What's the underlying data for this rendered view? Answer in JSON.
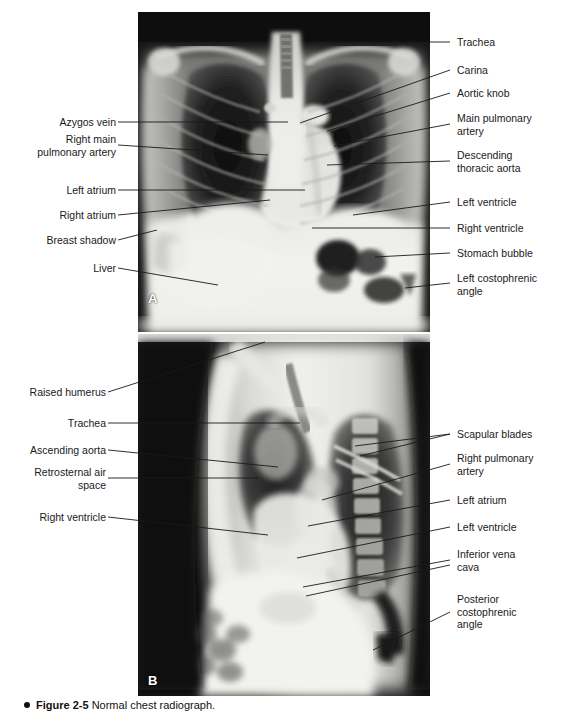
{
  "figure": {
    "caption_bullet": "●",
    "caption_label": "Figure 2-5",
    "caption_text": "Normal chest radiograph.",
    "panel_a_letter": "A",
    "panel_b_letter": "B"
  },
  "colors": {
    "text": "#1a1a1a",
    "leader": "#1a1a1a",
    "leader_on_film": "#f2f2f2",
    "page_background": "#ffffff",
    "film_dark": "#0d0d0d",
    "film_light": "#f0f0ee"
  },
  "panel_a": {
    "name": "posteroanterior-chest-radiograph",
    "labels_left": [
      {
        "id": "azygos-vein",
        "text": "Azygos vein"
      },
      {
        "id": "right-main-pulmonary-artery",
        "text": "Right main\npulmonary artery"
      },
      {
        "id": "left-atrium",
        "text": "Left atrium"
      },
      {
        "id": "right-atrium",
        "text": "Right atrium"
      },
      {
        "id": "breast-shadow",
        "text": "Breast shadow"
      },
      {
        "id": "liver",
        "text": "Liver"
      }
    ],
    "labels_right": [
      {
        "id": "trachea",
        "text": "Trachea"
      },
      {
        "id": "carina",
        "text": "Carina"
      },
      {
        "id": "aortic-knob",
        "text": "Aortic knob"
      },
      {
        "id": "main-pulmonary-artery",
        "text": "Main pulmonary\nartery"
      },
      {
        "id": "descending-thoracic-aorta",
        "text": "Descending\nthoracic aorta"
      },
      {
        "id": "left-ventricle",
        "text": "Left ventricle"
      },
      {
        "id": "right-ventricle",
        "text": "Right ventricle"
      },
      {
        "id": "stomach-bubble",
        "text": "Stomach bubble"
      },
      {
        "id": "left-costophrenic-angle",
        "text": "Left costophrenic\nangle"
      }
    ]
  },
  "panel_b": {
    "name": "lateral-chest-radiograph",
    "labels_left": [
      {
        "id": "raised-humerus",
        "text": "Raised humerus"
      },
      {
        "id": "trachea",
        "text": "Trachea"
      },
      {
        "id": "ascending-aorta",
        "text": "Ascending aorta"
      },
      {
        "id": "retrosternal-air-space",
        "text": "Retrosternal air\nspace"
      },
      {
        "id": "right-ventricle",
        "text": "Right ventricle"
      }
    ],
    "labels_right": [
      {
        "id": "scapular-blades",
        "text": "Scapular blades"
      },
      {
        "id": "right-pulmonary-artery",
        "text": "Right pulmonary\nartery"
      },
      {
        "id": "left-atrium",
        "text": "Left atrium"
      },
      {
        "id": "left-ventricle",
        "text": "Left ventricle"
      },
      {
        "id": "inferior-vena-cava",
        "text": "Inferior vena\ncava"
      },
      {
        "id": "posterior-costophrenic-angle",
        "text": "Posterior\ncostophrenic\nangle"
      }
    ]
  }
}
